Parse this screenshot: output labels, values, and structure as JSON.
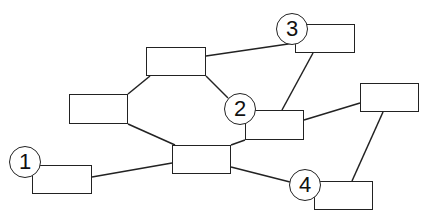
{
  "diagram": {
    "type": "network",
    "line_color": "#222222",
    "nodes": [
      {
        "id": "top",
        "x": 146,
        "y": 47,
        "w": 60,
        "h": 29
      },
      {
        "id": "left",
        "x": 69,
        "y": 94,
        "w": 59,
        "h": 30
      },
      {
        "id": "center",
        "x": 172,
        "y": 145,
        "w": 59,
        "h": 29
      },
      {
        "id": "n1",
        "x": 32,
        "y": 165,
        "w": 60,
        "h": 29
      },
      {
        "id": "n2",
        "x": 245,
        "y": 110,
        "w": 59,
        "h": 30
      },
      {
        "id": "n3",
        "x": 295,
        "y": 24,
        "w": 60,
        "h": 29
      },
      {
        "id": "right",
        "x": 360,
        "y": 83,
        "w": 59,
        "h": 29
      },
      {
        "id": "n4",
        "x": 314,
        "y": 181,
        "w": 59,
        "h": 29
      }
    ],
    "badges": [
      {
        "label": "1",
        "cx": 25,
        "cy": 162,
        "r": 16
      },
      {
        "label": "2",
        "cx": 240,
        "cy": 109,
        "r": 16
      },
      {
        "label": "3",
        "cx": 292,
        "cy": 29,
        "r": 16
      },
      {
        "label": "4",
        "cx": 305,
        "cy": 185,
        "r": 16
      }
    ],
    "edges": [
      {
        "x1": 206,
        "y1": 56,
        "x2": 295,
        "y2": 43
      },
      {
        "x1": 128,
        "y1": 94,
        "x2": 150,
        "y2": 76
      },
      {
        "x1": 206,
        "y1": 76,
        "x2": 228,
        "y2": 98
      },
      {
        "x1": 128,
        "y1": 124,
        "x2": 175,
        "y2": 145
      },
      {
        "x1": 92,
        "y1": 177,
        "x2": 172,
        "y2": 163
      },
      {
        "x1": 231,
        "y1": 145,
        "x2": 245,
        "y2": 140
      },
      {
        "x1": 231,
        "y1": 167,
        "x2": 290,
        "y2": 182
      },
      {
        "x1": 282,
        "y1": 110,
        "x2": 313,
        "y2": 53
      },
      {
        "x1": 304,
        "y1": 120,
        "x2": 360,
        "y2": 103
      },
      {
        "x1": 383,
        "y1": 112,
        "x2": 352,
        "y2": 181
      }
    ]
  },
  "caption": ""
}
